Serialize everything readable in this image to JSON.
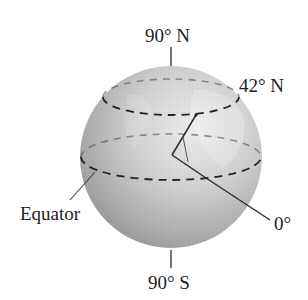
{
  "figure": {
    "type": "globe-latitude-diagram",
    "labels": {
      "north_pole": "90° N",
      "south_pole": "90° S",
      "latitude": "42° N",
      "equator": "Equator",
      "angle_origin": "0°"
    },
    "latitude_deg": 42,
    "colors": {
      "globe_light": "#e6e6e6",
      "globe_dark": "#8a8a8a",
      "line": "#2a2a2a",
      "text": "#222222"
    }
  }
}
